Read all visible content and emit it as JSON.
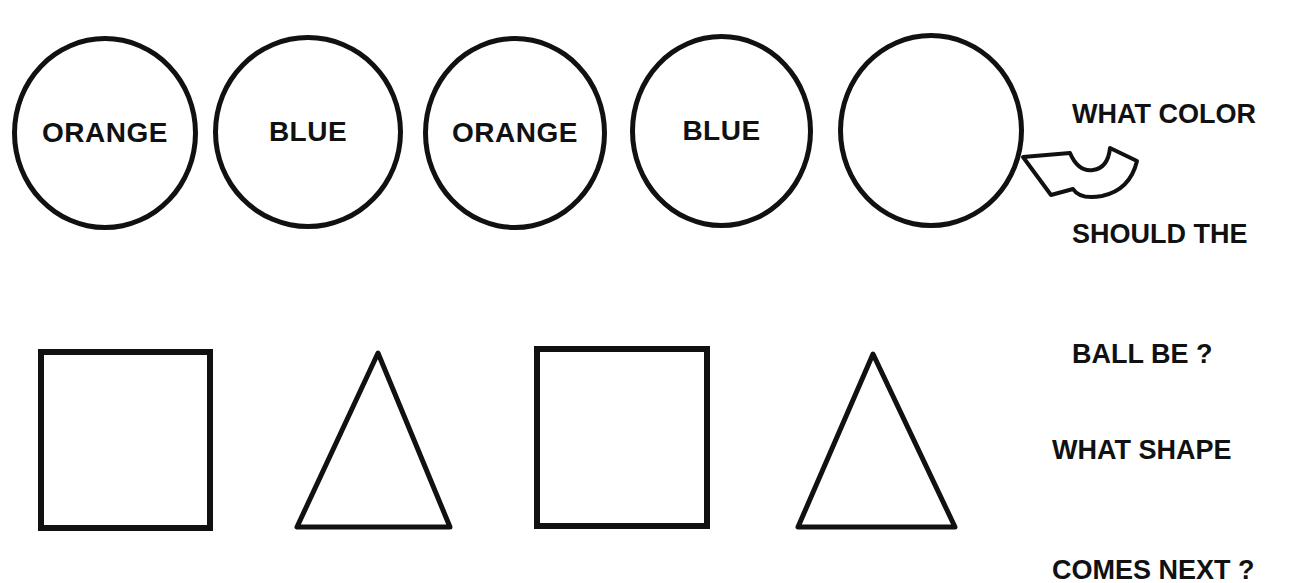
{
  "worksheet": {
    "color_pattern": {
      "balls": [
        {
          "label": "ORANGE"
        },
        {
          "label": "BLUE"
        },
        {
          "label": "ORANGE"
        },
        {
          "label": "BLUE"
        },
        {
          "label": ""
        }
      ],
      "question_line1": "WHAT COLOR",
      "question_line2": "SHOULD THE",
      "question_line3": "BALL BE ?",
      "pointer_icon": "curved-arrow-icon"
    },
    "shape_pattern": {
      "shapes": [
        "square",
        "triangle",
        "square",
        "triangle"
      ],
      "question_line1": "WHAT SHAPE",
      "question_line2": "COMES NEXT ?"
    }
  }
}
